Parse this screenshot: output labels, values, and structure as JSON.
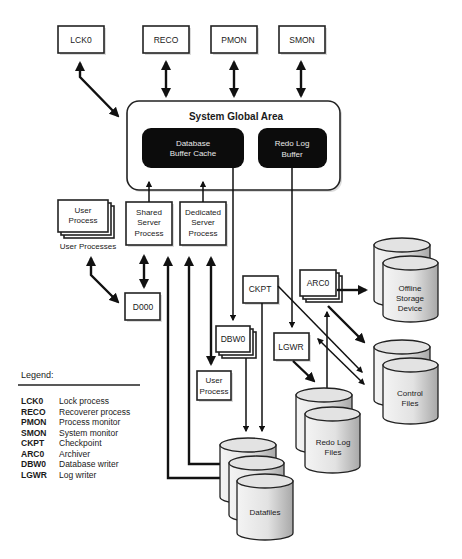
{
  "sga": {
    "title": "System Global Area",
    "db_buffer_cache": [
      "Database",
      "Buffer Cache"
    ],
    "redo_log_buffer": [
      "Redo Log",
      "Buffer"
    ]
  },
  "background_processes": {
    "lck0": "LCK0",
    "reco": "RECO",
    "pmon": "PMON",
    "smon": "SMON",
    "ckpt": "CKPT",
    "arc0": "ARC0",
    "dbw0": "DBW0",
    "lgwr": "LGWR",
    "d000": "D000"
  },
  "server_processes": {
    "shared": [
      "Shared",
      "Server",
      "Process"
    ],
    "dedicated": [
      "Dedicated",
      "Server",
      "Process"
    ]
  },
  "user_processes": {
    "stack_label": [
      "User",
      "Process"
    ],
    "caption": "User Processes",
    "single": [
      "User",
      "Process"
    ]
  },
  "storage": {
    "offline": [
      "Offline",
      "Storage",
      "Device"
    ],
    "control_files": [
      "Control",
      "Files"
    ],
    "redo_log_files": [
      "Redo Log",
      "Files"
    ],
    "datafiles": "Datafiles"
  },
  "legend": {
    "heading": "Legend:",
    "entries": [
      {
        "code": "LCK0",
        "desc": "Lock process"
      },
      {
        "code": "RECO",
        "desc": "Recoverer process"
      },
      {
        "code": "PMON",
        "desc": "Process monitor"
      },
      {
        "code": "SMON",
        "desc": "System monitor"
      },
      {
        "code": "CKPT",
        "desc": "Checkpoint"
      },
      {
        "code": "ARC0",
        "desc": "Archiver"
      },
      {
        "code": "DBW0",
        "desc": "Database writer"
      },
      {
        "code": "LGWR",
        "desc": "Log writer"
      }
    ]
  }
}
